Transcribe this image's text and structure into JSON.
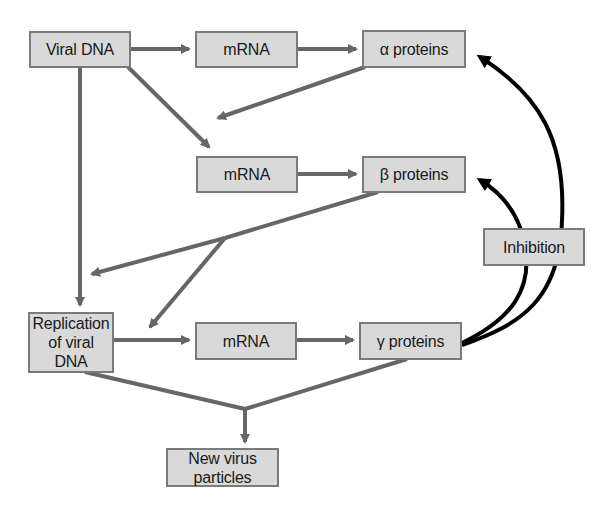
{
  "diagram": {
    "colors": {
      "box_fill": "#d9d9d9",
      "box_border": "#7a7a7a",
      "arrow_gray": "#666666",
      "inhibition_arrow": "#000000",
      "text": "#1a1a1a"
    },
    "nodes": {
      "viral_dna": {
        "label": "Viral DNA"
      },
      "mrna_alpha": {
        "label": "mRNA"
      },
      "alpha_proteins": {
        "label": "α proteins"
      },
      "mrna_beta": {
        "label": "mRNA"
      },
      "beta_proteins": {
        "label": "β proteins"
      },
      "inhibition": {
        "label": "Inhibition"
      },
      "replication": {
        "label": "Replication\nof viral DNA"
      },
      "mrna_gamma": {
        "label": "mRNA"
      },
      "gamma_proteins": {
        "label": "γ proteins"
      },
      "new_virus": {
        "label": "New virus particles"
      }
    },
    "edges": [
      {
        "from": "Viral DNA",
        "to": "mRNA (α)"
      },
      {
        "from": "mRNA (α)",
        "to": "α proteins"
      },
      {
        "from": "Viral DNA",
        "to": "mRNA (β)"
      },
      {
        "from": "α proteins",
        "to": "mRNA (β)"
      },
      {
        "from": "mRNA (β)",
        "to": "β proteins"
      },
      {
        "from": "Viral DNA",
        "to": "Replication of viral DNA"
      },
      {
        "from": "β proteins",
        "to": "Replication of viral DNA"
      },
      {
        "from": "Replication of viral DNA",
        "to": "mRNA (γ)"
      },
      {
        "from": "mRNA (γ)",
        "to": "γ proteins"
      },
      {
        "from": "Replication of viral DNA",
        "to": "New virus particles"
      },
      {
        "from": "γ proteins",
        "to": "New virus particles"
      },
      {
        "from": "γ proteins",
        "to": "α proteins",
        "type": "inhibition"
      },
      {
        "from": "γ proteins",
        "to": "β proteins",
        "type": "inhibition"
      }
    ]
  }
}
